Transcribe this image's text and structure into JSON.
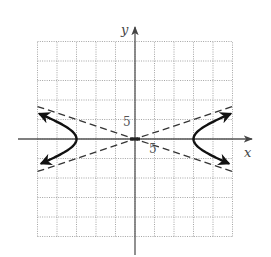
{
  "chart_data": {
    "type": "line",
    "title": "",
    "xlabel": "x",
    "ylabel": "y",
    "xlim": [
      -25,
      25
    ],
    "ylim": [
      -25,
      25
    ],
    "grid": true,
    "grid_step": 5,
    "tick_labels": [
      {
        "axis": "y",
        "value": 5,
        "text": "5"
      },
      {
        "axis": "x",
        "value": 5,
        "text": "5"
      }
    ],
    "legend": null,
    "equation": "x^2/225 - y^2/25 = 1",
    "vertices": [
      [
        -15,
        0
      ],
      [
        15,
        0
      ]
    ],
    "center": [
      0,
      0
    ],
    "series": [
      {
        "name": "hyperbola-right-branch",
        "style": "solid-with-arrows",
        "points": [
          [
            24.4,
            6.4
          ],
          [
            21,
            4.9
          ],
          [
            18,
            3.3
          ],
          [
            16,
            1.86
          ],
          [
            15,
            0
          ],
          [
            16,
            -1.86
          ],
          [
            18,
            -3.3
          ],
          [
            21,
            -4.9
          ],
          [
            24.4,
            -6.4
          ]
        ]
      },
      {
        "name": "hyperbola-left-branch",
        "style": "solid-with-arrows",
        "points": [
          [
            -24.4,
            6.4
          ],
          [
            -21,
            4.9
          ],
          [
            -18,
            3.3
          ],
          [
            -16,
            1.86
          ],
          [
            -15,
            0
          ],
          [
            -16,
            -1.86
          ],
          [
            -18,
            -3.3
          ],
          [
            -21,
            -4.9
          ],
          [
            -24.4,
            -6.4
          ]
        ]
      },
      {
        "name": "asymptote y = x/3",
        "style": "dashed",
        "points": [
          [
            -25,
            -8.33
          ],
          [
            25,
            8.33
          ]
        ]
      },
      {
        "name": "asymptote y = -x/3",
        "style": "dashed",
        "points": [
          [
            -25,
            8.33
          ],
          [
            25,
            -8.33
          ]
        ]
      }
    ]
  },
  "labels": {
    "x_axis": "x",
    "y_axis": "y",
    "y_tick": "5",
    "x_tick": "5"
  }
}
